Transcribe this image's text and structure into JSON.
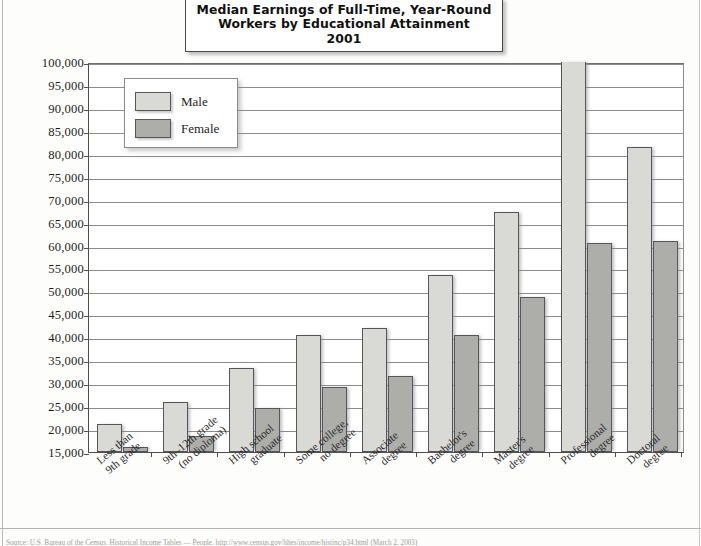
{
  "title": {
    "line1": "Median Earnings of Full-Time, Year-Round",
    "line2": "Workers by Educational Attainment",
    "line3": "2001"
  },
  "legend": {
    "items": [
      {
        "label": "Male",
        "color": "#d9d9d6"
      },
      {
        "label": "Female",
        "color": "#adadaa"
      }
    ],
    "position": "inside-top-left"
  },
  "footer": {
    "source": "Source: U.S. Bureau of the Census. Historical Income Tables — People. http://www.census.gov/hhes/income/histinc/p34.html (March 2, 2003)"
  },
  "axis": {
    "y_ticks": [
      "100,000",
      "95,000",
      "90,000",
      "85,000",
      "80,000",
      "75,000",
      "70,000",
      "65,000",
      "60,000",
      "55,000",
      "50,000",
      "45,000",
      "40,000",
      "35,000",
      "30,000",
      "25,000",
      "20,000",
      "15,000"
    ]
  },
  "chart_data": {
    "type": "bar",
    "title": "Median Earnings of Full-Time, Year-Round Workers by Educational Attainment 2001",
    "xlabel": "",
    "ylabel": "",
    "ylim": [
      15000,
      100000
    ],
    "ytick_step": 5000,
    "grid": true,
    "legend_position": "inside-top-left",
    "categories": [
      "Less than 9th grade",
      "9th–12th grade (no diploma)",
      "High school graduate",
      "Some college, no degree",
      "Associate degree",
      "Bachelor's degree",
      "Master's degree",
      "Professional degree",
      "Doctoral degree"
    ],
    "category_lines": [
      [
        "Less than",
        "9th grade"
      ],
      [
        "9th–12th grade",
        "(no diploma)"
      ],
      [
        "High school",
        "graduate"
      ],
      [
        "Some college,",
        "no degree"
      ],
      [
        "Associate",
        "degree"
      ],
      [
        "Bachelor's",
        "degree"
      ],
      [
        "Master's",
        "degree"
      ],
      [
        "Professional",
        "degree"
      ],
      [
        "Doctoral",
        "degree"
      ]
    ],
    "series": [
      {
        "name": "Male",
        "color": "#d9d9d6",
        "values": [
          21000,
          26000,
          33300,
          40600,
          42000,
          53600,
          67300,
          100000,
          81500
        ]
      },
      {
        "name": "Female",
        "color": "#adadaa",
        "values": [
          16200,
          18500,
          24500,
          29200,
          31600,
          40500,
          48800,
          60500,
          61000
        ]
      }
    ]
  }
}
